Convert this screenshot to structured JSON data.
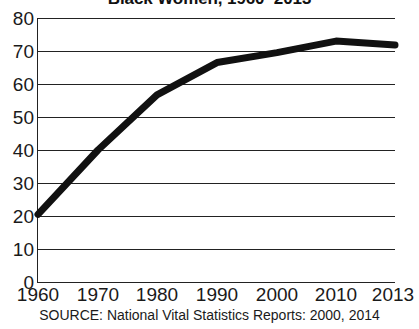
{
  "chart_data": {
    "type": "line",
    "title": "Black Women, 1960–2013",
    "subtitle": "",
    "xlabel": "",
    "ylabel": "",
    "x": [
      1960,
      1970,
      1980,
      1990,
      2000,
      2010,
      2013
    ],
    "values": [
      20.5,
      40.0,
      56.7,
      66.5,
      69.5,
      73.0,
      71.8
    ],
    "series": [
      {
        "name": "Black Women",
        "values": [
          20.5,
          40.0,
          56.7,
          66.5,
          69.5,
          73.0,
          71.8
        ]
      }
    ],
    "categories": [
      "1960",
      "1970",
      "1980",
      "1990",
      "2000",
      "2010",
      "2013"
    ],
    "xtick_labels": [
      "1960",
      "1970",
      "1980",
      "1990",
      "2000",
      "2010",
      "2013"
    ],
    "ytick_labels": [
      "0",
      "10",
      "20",
      "30",
      "40",
      "50",
      "60",
      "70",
      "80"
    ],
    "yticks": [
      0,
      10,
      20,
      30,
      40,
      50,
      60,
      70,
      80
    ],
    "ylim": [
      0,
      80
    ],
    "xlim": [
      1960,
      2013
    ],
    "grid": "horizontal",
    "legend": "none",
    "line_color": "#111111",
    "grid_color": "#222222",
    "background_color": "#ffffff"
  },
  "source_note": "SOURCE: National Vital Statistics Reports: 2000, 2014"
}
